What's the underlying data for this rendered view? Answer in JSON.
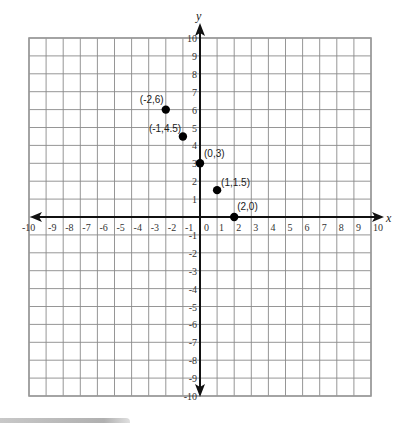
{
  "chart_data": {
    "type": "scatter",
    "title": "",
    "xlabel": "x",
    "ylabel": "y",
    "xlim": [
      -10,
      10
    ],
    "ylim": [
      -10,
      10
    ],
    "grid": true,
    "x_ticks": [
      -10,
      -9,
      -8,
      -7,
      -6,
      -5,
      -4,
      -3,
      -2,
      -1,
      0,
      1,
      2,
      3,
      4,
      5,
      6,
      7,
      8,
      9,
      10
    ],
    "y_ticks": [
      -10,
      -9,
      -8,
      -7,
      -6,
      -5,
      -4,
      -3,
      -2,
      -1,
      1,
      2,
      3,
      4,
      5,
      6,
      7,
      8,
      9,
      10
    ],
    "points": [
      {
        "x": -2,
        "y": 6,
        "label": "(-2,6)"
      },
      {
        "x": -1,
        "y": 4.5,
        "label": "(-1,4.5)"
      },
      {
        "x": 0,
        "y": 3,
        "label": "(0,3)"
      },
      {
        "x": 1,
        "y": 1.5,
        "label": "(1,1.5)"
      },
      {
        "x": 2,
        "y": 0,
        "label": "(2,0)"
      }
    ],
    "point_color": "#000000",
    "grid_color": "#8a8a8a",
    "axis_color": "#111111"
  }
}
